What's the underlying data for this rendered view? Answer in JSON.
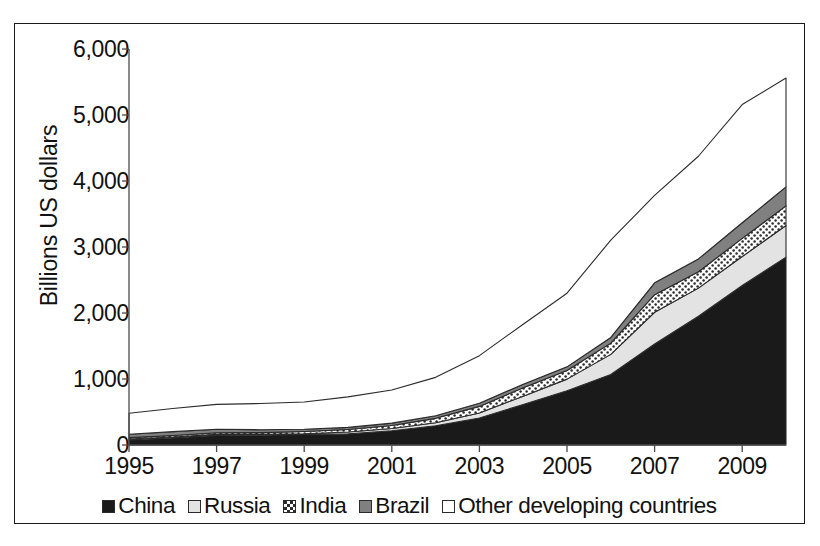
{
  "figure": {
    "y_axis_title": "Billions US dollars",
    "border_color": "#1a1a1a"
  },
  "legend": {
    "position": "bottom-center",
    "items": [
      {
        "label": "China",
        "swatch": "solid-black-swatch",
        "color": "#1a1a1a",
        "pattern": "solid"
      },
      {
        "label": "Russia",
        "swatch": "light-gray-swatch",
        "color": "#e3e3e3",
        "pattern": "solid"
      },
      {
        "label": "India",
        "swatch": "dotted-white-swatch",
        "color": "#ffffff",
        "pattern": "dots"
      },
      {
        "label": "Brazil",
        "swatch": "medium-gray-swatch",
        "color": "#808080",
        "pattern": "solid"
      },
      {
        "label": "Other developing countries",
        "swatch": "white-swatch",
        "color": "#ffffff",
        "pattern": "solid"
      }
    ]
  },
  "chart_data": {
    "type": "area",
    "stacked": true,
    "title": "",
    "xlabel": "",
    "ylabel": "Billions US dollars",
    "grid": false,
    "legend_position": "bottom",
    "x": [
      1995,
      1996,
      1997,
      1998,
      1999,
      2000,
      2001,
      2002,
      2003,
      2004,
      2005,
      2006,
      2007,
      2008,
      2009,
      2010
    ],
    "x_tick_labels": [
      "1995",
      "1997",
      "1999",
      "2001",
      "2003",
      "2005",
      "2007",
      "2009"
    ],
    "x_tick_values": [
      1995,
      1997,
      1999,
      2001,
      2003,
      2005,
      2007,
      2009
    ],
    "xlim": [
      1995,
      2010
    ],
    "y_tick_labels": [
      "0",
      "1,000",
      "2,000",
      "3,000",
      "4,000",
      "5,000",
      "6,000"
    ],
    "y_tick_values": [
      0,
      1000,
      2000,
      3000,
      4000,
      5000,
      6000
    ],
    "ylim": [
      0,
      6000
    ],
    "series": [
      {
        "name": "China",
        "color": "#1a1a1a",
        "pattern": "solid",
        "values": [
          75,
          107,
          143,
          149,
          158,
          168,
          216,
          292,
          408,
          615,
          822,
          1069,
          1531,
          1950,
          2416,
          2847
        ]
      },
      {
        "name": "Russia",
        "color": "#e3e3e3",
        "pattern": "solid",
        "values": [
          17,
          15,
          18,
          12,
          13,
          28,
          33,
          44,
          78,
          125,
          176,
          304,
          479,
          427,
          439,
          479
        ]
      },
      {
        "name": "India",
        "color": "#ffffff",
        "pattern": "dots",
        "values": [
          20,
          22,
          25,
          27,
          33,
          38,
          46,
          68,
          99,
          127,
          132,
          171,
          267,
          248,
          275,
          297
        ]
      },
      {
        "name": "Brazil",
        "color": "#808080",
        "pattern": "solid",
        "values": [
          50,
          58,
          52,
          44,
          35,
          33,
          36,
          38,
          49,
          53,
          54,
          86,
          180,
          194,
          238,
          289
        ]
      },
      {
        "name": "Other developing countries",
        "color": "#ffffff",
        "pattern": "solid",
        "values": [
          318,
          352,
          378,
          396,
          412,
          462,
          502,
          583,
          720,
          910,
          1116,
          1475,
          1325,
          1556,
          1790,
          1648
        ]
      }
    ],
    "totals": [
      480,
      554,
      616,
      628,
      651,
      729,
      833,
      1025,
      1354,
      1830,
      2300,
      3105,
      3782,
      4375,
      5158,
      5560
    ],
    "annotations": []
  }
}
